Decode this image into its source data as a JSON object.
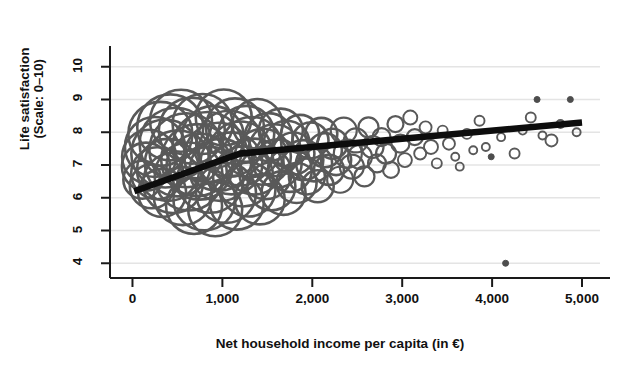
{
  "chart_data": {
    "type": "scatter",
    "title": "Germany",
    "xlabel": "Net household income per capita (in €)",
    "ylabel_line1": "Life satisfaction",
    "ylabel_line2": "(Scale: 0–10)",
    "xlim": [
      -250,
      5200
    ],
    "ylim": [
      3.55,
      10.45
    ],
    "xticks": [
      0,
      1000,
      2000,
      3000,
      4000,
      5000
    ],
    "xticklabels": [
      "0",
      "1,000",
      "2,000",
      "3,000",
      "4,000",
      "5,000"
    ],
    "yticks": [
      4,
      5,
      6,
      7,
      8,
      9,
      10
    ],
    "yticklabels": [
      "4",
      "5",
      "6",
      "7",
      "8",
      "9",
      "10"
    ],
    "grid": "horizontal",
    "legend": "none",
    "marker_style": "hollow-circle-bubble",
    "colors": {
      "bubble_stroke": "#595959",
      "marker_fill": "#4d4d4d",
      "trend_line": "#0d0d0d",
      "gridline": "#e4e4e4",
      "axis": "#1a1a1a",
      "text": "#111111",
      "background": "#ffffff"
    },
    "series": [
      {
        "name": "Income-satisfaction bubbles",
        "note": "bubble size proportional to number of observations at that income level",
        "points": [
          {
            "x": 110,
            "y": 6.55,
            "r": 19
          },
          {
            "x": 150,
            "y": 6.95,
            "r": 24
          },
          {
            "x": 185,
            "y": 7.25,
            "r": 27
          },
          {
            "x": 215,
            "y": 6.35,
            "r": 22
          },
          {
            "x": 250,
            "y": 7.55,
            "r": 30
          },
          {
            "x": 275,
            "y": 6.75,
            "r": 26
          },
          {
            "x": 310,
            "y": 7.95,
            "r": 32
          },
          {
            "x": 330,
            "y": 6.15,
            "r": 24
          },
          {
            "x": 365,
            "y": 7.35,
            "r": 34
          },
          {
            "x": 395,
            "y": 6.85,
            "r": 31
          },
          {
            "x": 420,
            "y": 8.15,
            "r": 33
          },
          {
            "x": 450,
            "y": 6.45,
            "r": 30
          },
          {
            "x": 480,
            "y": 7.65,
            "r": 36
          },
          {
            "x": 505,
            "y": 7.05,
            "r": 33
          },
          {
            "x": 540,
            "y": 8.35,
            "r": 31
          },
          {
            "x": 560,
            "y": 6.05,
            "r": 29
          },
          {
            "x": 600,
            "y": 7.45,
            "r": 37
          },
          {
            "x": 625,
            "y": 6.65,
            "r": 34
          },
          {
            "x": 660,
            "y": 8.05,
            "r": 33
          },
          {
            "x": 685,
            "y": 5.75,
            "r": 28
          },
          {
            "x": 720,
            "y": 7.15,
            "r": 36
          },
          {
            "x": 745,
            "y": 6.95,
            "r": 33
          },
          {
            "x": 780,
            "y": 8.25,
            "r": 30
          },
          {
            "x": 800,
            "y": 5.95,
            "r": 31
          },
          {
            "x": 835,
            "y": 7.55,
            "r": 35
          },
          {
            "x": 865,
            "y": 6.55,
            "r": 33
          },
          {
            "x": 895,
            "y": 7.85,
            "r": 31
          },
          {
            "x": 920,
            "y": 5.65,
            "r": 27
          },
          {
            "x": 955,
            "y": 7.25,
            "r": 34
          },
          {
            "x": 980,
            "y": 6.85,
            "r": 31
          },
          {
            "x": 1015,
            "y": 8.45,
            "r": 28
          },
          {
            "x": 1040,
            "y": 6.15,
            "r": 30
          },
          {
            "x": 1075,
            "y": 7.65,
            "r": 33
          },
          {
            "x": 1100,
            "y": 7.05,
            "r": 31
          },
          {
            "x": 1140,
            "y": 8.15,
            "r": 29
          },
          {
            "x": 1160,
            "y": 5.85,
            "r": 27
          },
          {
            "x": 1200,
            "y": 7.35,
            "r": 32
          },
          {
            "x": 1230,
            "y": 6.65,
            "r": 30
          },
          {
            "x": 1265,
            "y": 7.95,
            "r": 28
          },
          {
            "x": 1290,
            "y": 6.25,
            "r": 27
          },
          {
            "x": 1325,
            "y": 7.55,
            "r": 30
          },
          {
            "x": 1355,
            "y": 6.95,
            "r": 28
          },
          {
            "x": 1390,
            "y": 8.25,
            "r": 25
          },
          {
            "x": 1415,
            "y": 5.95,
            "r": 25
          },
          {
            "x": 1450,
            "y": 7.25,
            "r": 28
          },
          {
            "x": 1480,
            "y": 6.75,
            "r": 26
          },
          {
            "x": 1515,
            "y": 7.85,
            "r": 24
          },
          {
            "x": 1545,
            "y": 6.35,
            "r": 24
          },
          {
            "x": 1580,
            "y": 7.45,
            "r": 26
          },
          {
            "x": 1615,
            "y": 7.05,
            "r": 24
          },
          {
            "x": 1650,
            "y": 8.05,
            "r": 22
          },
          {
            "x": 1680,
            "y": 6.15,
            "r": 22
          },
          {
            "x": 1715,
            "y": 7.65,
            "r": 23
          },
          {
            "x": 1750,
            "y": 6.85,
            "r": 22
          },
          {
            "x": 1790,
            "y": 7.35,
            "r": 21
          },
          {
            "x": 1825,
            "y": 6.45,
            "r": 20
          },
          {
            "x": 1865,
            "y": 7.95,
            "r": 19
          },
          {
            "x": 1900,
            "y": 7.15,
            "r": 20
          },
          {
            "x": 1940,
            "y": 6.65,
            "r": 18
          },
          {
            "x": 1980,
            "y": 7.75,
            "r": 18
          },
          {
            "x": 2020,
            "y": 7.05,
            "r": 18
          },
          {
            "x": 2060,
            "y": 6.35,
            "r": 16
          },
          {
            "x": 2100,
            "y": 7.95,
            "r": 16
          },
          {
            "x": 2140,
            "y": 7.45,
            "r": 17
          },
          {
            "x": 2185,
            "y": 6.85,
            "r": 15
          },
          {
            "x": 2225,
            "y": 7.65,
            "r": 15
          },
          {
            "x": 2265,
            "y": 7.15,
            "r": 15
          },
          {
            "x": 2310,
            "y": 6.55,
            "r": 13
          },
          {
            "x": 2350,
            "y": 8.05,
            "r": 13
          },
          {
            "x": 2395,
            "y": 7.35,
            "r": 14
          },
          {
            "x": 2440,
            "y": 6.95,
            "r": 12
          },
          {
            "x": 2485,
            "y": 7.75,
            "r": 12
          },
          {
            "x": 2530,
            "y": 7.25,
            "r": 12
          },
          {
            "x": 2580,
            "y": 6.65,
            "r": 10
          },
          {
            "x": 2625,
            "y": 8.15,
            "r": 10
          },
          {
            "x": 2670,
            "y": 7.55,
            "r": 11
          },
          {
            "x": 2720,
            "y": 7.05,
            "r": 9
          },
          {
            "x": 2770,
            "y": 7.85,
            "r": 9
          },
          {
            "x": 2820,
            "y": 7.35,
            "r": 10
          },
          {
            "x": 2875,
            "y": 6.85,
            "r": 8
          },
          {
            "x": 2925,
            "y": 8.25,
            "r": 8
          },
          {
            "x": 2980,
            "y": 7.65,
            "r": 9
          },
          {
            "x": 3030,
            "y": 7.15,
            "r": 7
          },
          {
            "x": 3090,
            "y": 8.45,
            "r": 7
          },
          {
            "x": 3140,
            "y": 7.85,
            "r": 8
          },
          {
            "x": 3200,
            "y": 7.35,
            "r": 6
          },
          {
            "x": 3260,
            "y": 8.15,
            "r": 6
          },
          {
            "x": 3320,
            "y": 7.55,
            "r": 7
          },
          {
            "x": 3385,
            "y": 7.05,
            "r": 5
          },
          {
            "x": 3450,
            "y": 8.05,
            "r": 5
          },
          {
            "x": 3520,
            "y": 7.65,
            "r": 6
          },
          {
            "x": 3590,
            "y": 7.25,
            "r": 4
          },
          {
            "x": 3640,
            "y": 6.95,
            "r": 4
          },
          {
            "x": 3720,
            "y": 7.95,
            "r": 5
          },
          {
            "x": 3790,
            "y": 7.45,
            "r": 4
          },
          {
            "x": 3860,
            "y": 8.35,
            "r": 5
          },
          {
            "x": 3930,
            "y": 7.55,
            "r": 4
          },
          {
            "x": 3990,
            "y": 7.25,
            "r": 3
          },
          {
            "x": 4100,
            "y": 7.85,
            "r": 4
          },
          {
            "x": 4150,
            "y": 4.0,
            "r": 3
          },
          {
            "x": 4250,
            "y": 7.35,
            "r": 5
          },
          {
            "x": 4340,
            "y": 8.05,
            "r": 4
          },
          {
            "x": 4430,
            "y": 8.45,
            "r": 5
          },
          {
            "x": 4500,
            "y": 9.0,
            "r": 3
          },
          {
            "x": 4560,
            "y": 7.9,
            "r": 4
          },
          {
            "x": 4660,
            "y": 7.75,
            "r": 6
          },
          {
            "x": 4760,
            "y": 8.25,
            "r": 4
          },
          {
            "x": 4870,
            "y": 9.0,
            "r": 3
          },
          {
            "x": 4940,
            "y": 8.0,
            "r": 4
          }
        ]
      }
    ],
    "trend_line": {
      "name": "Fitted spline (piecewise linear)",
      "points": [
        {
          "x": 20,
          "y": 6.2
        },
        {
          "x": 1200,
          "y": 7.35
        },
        {
          "x": 3000,
          "y": 7.8
        },
        {
          "x": 5000,
          "y": 8.3
        }
      ]
    }
  }
}
